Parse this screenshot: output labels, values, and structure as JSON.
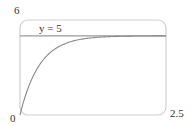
{
  "chart_data": {
    "type": "line",
    "title": "",
    "xlabel": "",
    "ylabel": "",
    "xlim": [
      0,
      2.5
    ],
    "ylim": [
      0,
      6
    ],
    "grid": false,
    "tick_labels": {
      "y_top": "6",
      "origin": "0",
      "x_right": "2.5"
    },
    "series": [
      {
        "name": "y = 5(1 - e^(-3t))",
        "x": [
          0,
          0.1,
          0.2,
          0.3,
          0.4,
          0.5,
          0.6,
          0.8,
          1.0,
          1.25,
          1.5,
          2.0,
          2.5
        ],
        "values": [
          0,
          1.3,
          2.26,
          2.97,
          3.49,
          3.88,
          4.17,
          4.55,
          4.75,
          4.88,
          4.94,
          4.99,
          5.0
        ]
      }
    ],
    "annotations": [
      {
        "type": "hline",
        "y": 5,
        "label": "y = 5"
      }
    ],
    "colors": {
      "curve": "#888888",
      "asymptote": "#999999",
      "frame": "#c8c8c8"
    }
  }
}
